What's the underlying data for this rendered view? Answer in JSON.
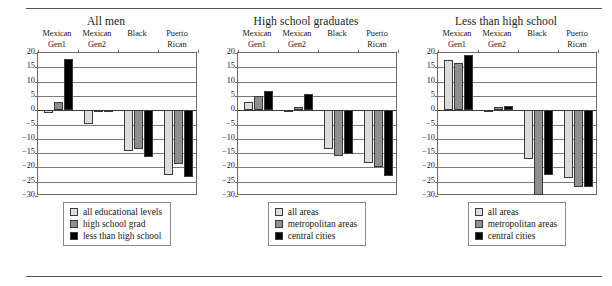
{
  "figure": {
    "top_rule": "horizontal-rule",
    "bottom_rule": "horizontal-rule"
  },
  "colors": {
    "series_light": "#dcdcdc",
    "series_gray": "#8f8f8f",
    "series_black": "#000000",
    "axis": "#6b6b6b",
    "grid": "#7a7a7a",
    "text": "#1a1a1a"
  },
  "chart_data": [
    {
      "type": "bar",
      "title": "All men",
      "xlabel": "",
      "ylabel": "",
      "ylim": [
        -30,
        20
      ],
      "yticks": [
        20,
        15,
        10,
        5,
        0,
        -5,
        -10,
        -15,
        -20,
        -25,
        -30
      ],
      "ytick_labels": [
        "20",
        "15",
        "10",
        "5",
        "0",
        "−5",
        "−10",
        "−15",
        "−20",
        "−25",
        "−30"
      ],
      "grid": true,
      "legend_position": "below-plot",
      "categories": [
        "Mexican Gen1",
        "Mexican Gen2",
        "Black",
        "Puerto Rican"
      ],
      "category_lines": [
        [
          "Mexican",
          "Gen1"
        ],
        [
          "Mexican",
          "Gen2"
        ],
        [
          "",
          "Black"
        ],
        [
          "Puerto",
          "Rican"
        ]
      ],
      "series": [
        {
          "name": "all educational levels",
          "color": "#dcdcdc",
          "values": [
            -1.0,
            -5.0,
            -14.2,
            -22.5
          ]
        },
        {
          "name": "high school grad",
          "color": "#8f8f8f",
          "values": [
            3.0,
            0.0,
            -13.7,
            -18.8
          ]
        },
        {
          "name": "less than high school",
          "color": "#000000",
          "values": [
            18.0,
            -0.5,
            -16.5,
            -23.5
          ]
        }
      ]
    },
    {
      "type": "bar",
      "title": "High school graduates",
      "xlabel": "",
      "ylabel": "",
      "ylim": [
        -30,
        20
      ],
      "yticks": [
        20,
        15,
        10,
        5,
        0,
        -5,
        -10,
        -15,
        -20,
        -25,
        -30
      ],
      "ytick_labels": [
        "20",
        "15",
        "10",
        "5",
        "0",
        "−5",
        "−10",
        "−15",
        "−20",
        "−25",
        "−30"
      ],
      "grid": true,
      "legend_position": "below-plot",
      "categories": [
        "Mexican Gen1",
        "Mexican Gen2",
        "Black",
        "Puerto Rican"
      ],
      "category_lines": [
        [
          "Mexican",
          "Gen1"
        ],
        [
          "Mexican",
          "Gen2"
        ],
        [
          "",
          "Black"
        ],
        [
          "Puerto",
          "Rican"
        ]
      ],
      "series": [
        {
          "name": "all areas",
          "color": "#dcdcdc",
          "values": [
            2.7,
            -0.3,
            -13.7,
            -18.5
          ]
        },
        {
          "name": "metropolitan areas",
          "color": "#8f8f8f",
          "values": [
            5.0,
            1.0,
            -16.0,
            -19.8
          ]
        },
        {
          "name": "central cities",
          "color": "#000000",
          "values": [
            6.8,
            5.5,
            -15.3,
            -23.0
          ]
        }
      ]
    },
    {
      "type": "bar",
      "title": "Less than high school",
      "xlabel": "",
      "ylabel": "",
      "ylim": [
        -30,
        20
      ],
      "yticks": [
        20,
        15,
        10,
        5,
        0,
        -5,
        -10,
        -15,
        -20,
        -25,
        -30
      ],
      "ytick_labels": [
        "20",
        "15",
        "10",
        "5",
        "0",
        "−5",
        "−10",
        "−15",
        "−20",
        "−25",
        "−30"
      ],
      "grid": true,
      "legend_position": "below-plot",
      "categories": [
        "Mexican Gen1",
        "Mexican Gen2",
        "Black",
        "Puerto Rican"
      ],
      "category_lines": [
        [
          "Mexican",
          "Gen1"
        ],
        [
          "Mexican",
          "Gen2"
        ],
        [
          "",
          "Black"
        ],
        [
          "Puerto",
          "Rican"
        ]
      ],
      "series": [
        {
          "name": "all areas",
          "color": "#dcdcdc",
          "values": [
            17.5,
            -0.3,
            -17.0,
            -23.8
          ]
        },
        {
          "name": "metropolitan areas",
          "color": "#8f8f8f",
          "values": [
            16.5,
            1.0,
            -29.5,
            -27.0
          ]
        },
        {
          "name": "central cities",
          "color": "#000000",
          "values": [
            19.3,
            1.5,
            -22.5,
            -27.0
          ]
        }
      ]
    }
  ]
}
